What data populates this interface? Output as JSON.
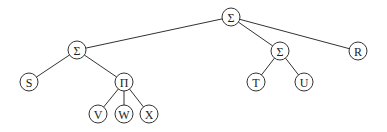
{
  "diagram": {
    "type": "tree",
    "node_radius": 9,
    "nodes": [
      {
        "id": "root",
        "label": "Σ",
        "x": 231,
        "y": 17
      },
      {
        "id": "sum_left",
        "label": "Σ",
        "x": 77,
        "y": 50
      },
      {
        "id": "S",
        "label": "S",
        "x": 29,
        "y": 82
      },
      {
        "id": "prod",
        "label": "Π",
        "x": 124,
        "y": 82
      },
      {
        "id": "V",
        "label": "V",
        "x": 98,
        "y": 114
      },
      {
        "id": "W",
        "label": "W",
        "x": 124,
        "y": 114
      },
      {
        "id": "X",
        "label": "X",
        "x": 149,
        "y": 114
      },
      {
        "id": "sum_right",
        "label": "Σ",
        "x": 280,
        "y": 51
      },
      {
        "id": "T",
        "label": "T",
        "x": 256,
        "y": 82
      },
      {
        "id": "U",
        "label": "U",
        "x": 304,
        "y": 82
      },
      {
        "id": "R",
        "label": "R",
        "x": 358,
        "y": 51
      }
    ],
    "edges": [
      [
        "root",
        "sum_left"
      ],
      [
        "root",
        "sum_right"
      ],
      [
        "root",
        "R"
      ],
      [
        "sum_left",
        "S"
      ],
      [
        "sum_left",
        "prod"
      ],
      [
        "prod",
        "V"
      ],
      [
        "prod",
        "W"
      ],
      [
        "prod",
        "X"
      ],
      [
        "sum_right",
        "T"
      ],
      [
        "sum_right",
        "U"
      ]
    ]
  }
}
